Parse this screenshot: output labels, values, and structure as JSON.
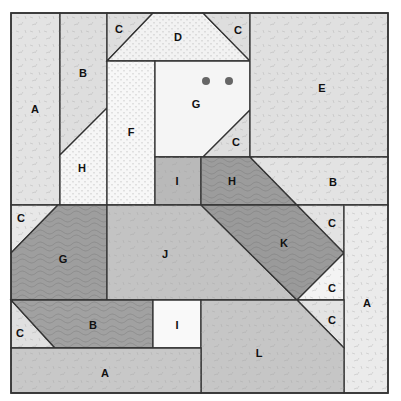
{
  "diagram": {
    "type": "quilt-block-pattern",
    "colors": {
      "light_print": "#e6e6e6",
      "pale_print": "#f1f1f1",
      "dotted_white": "#f6f6f6",
      "white": "#fafafa",
      "medium_print": "#c4c4c4",
      "dark_swirl": "#9d9d9d",
      "outline": "#333333",
      "eye": "#666666"
    },
    "pieces": [
      {
        "id": "A-left",
        "label": "A",
        "fill": "#e3e3e3",
        "points": "11,13 60,13 60,205 11,205",
        "lx": 35,
        "ly": 109
      },
      {
        "id": "B-top",
        "label": "B",
        "fill": "#dedede",
        "points": "60,13 107,13 107,108 60,155",
        "lx": 83,
        "ly": 73
      },
      {
        "id": "H-left",
        "label": "H",
        "fill": "#f6f6f6",
        "points": "60,155 107,108 107,205 60,205",
        "lx": 82,
        "ly": 168
      },
      {
        "id": "C-top-left",
        "label": "C",
        "fill": "#dedede",
        "points": "107,13 153,13 107,61",
        "lx": 119,
        "ly": 29
      },
      {
        "id": "D",
        "label": "D",
        "fill": "#f2f2f2",
        "points": "153,13 203,13 250,61 107,61",
        "lx": 178,
        "ly": 37
      },
      {
        "id": "C-top-right",
        "label": "C",
        "fill": "#dedede",
        "points": "203,13 250,13 250,61",
        "lx": 238,
        "ly": 30
      },
      {
        "id": "F",
        "label": "F",
        "fill": "#f7f7f7",
        "points": "107,61 155,61 155,205 107,205",
        "lx": 131,
        "ly": 132
      },
      {
        "id": "G-face",
        "label": "G",
        "fill": "#f5f5f5",
        "points": "155,61 250,61 250,110 203,157 155,157",
        "lx": 196,
        "ly": 104
      },
      {
        "id": "C-face",
        "label": "C",
        "fill": "#dedede",
        "points": "250,110 250,157 203,157",
        "lx": 236,
        "ly": 142
      },
      {
        "id": "E",
        "label": "E",
        "fill": "#e0e0e0",
        "points": "250,13 388,13 388,157 250,157",
        "lx": 322,
        "ly": 88
      },
      {
        "id": "I-mid",
        "label": "I",
        "fill": "#b9b9b9",
        "points": "155,157 201,157 201,205 155,205",
        "lx": 177,
        "ly": 181
      },
      {
        "id": "H-dark",
        "label": "H",
        "fill": "#9c9c9c",
        "points": "201,157 250,157 297,205 201,205",
        "lx": 232,
        "ly": 181
      },
      {
        "id": "B-right",
        "label": "B",
        "fill": "#e3e3e3",
        "points": "250,157 388,157 388,205 297,205",
        "lx": 333,
        "ly": 182
      },
      {
        "id": "C-row2-left",
        "label": "C",
        "fill": "#e8e8e8",
        "points": "11,205 58,205 11,253",
        "lx": 21,
        "ly": 218
      },
      {
        "id": "G-dark",
        "label": "G",
        "fill": "#9e9e9e",
        "points": "58,205 107,205 107,300 11,300 11,253",
        "lx": 63,
        "ly": 259
      },
      {
        "id": "J",
        "label": "J",
        "fill": "#c3c3c3",
        "points": "107,205 201,205 297,300 107,300",
        "lx": 165,
        "ly": 254
      },
      {
        "id": "K",
        "label": "K",
        "fill": "#9a9a9a",
        "points": "201,205 297,205 344,253 297,300",
        "lx": 284,
        "ly": 243
      },
      {
        "id": "C-k-top",
        "label": "C",
        "fill": "#e3e3e3",
        "points": "297,205 344,205 344,253",
        "lx": 332,
        "ly": 223
      },
      {
        "id": "C-k-bottom",
        "label": "C",
        "fill": "#f3f3f3",
        "points": "344,253 344,300 297,300",
        "lx": 332,
        "ly": 288
      },
      {
        "id": "A-right",
        "label": "A",
        "fill": "#ebebeb",
        "points": "344,205 388,205 388,393 344,393",
        "lx": 367,
        "ly": 303
      },
      {
        "id": "C-row3-left",
        "label": "C",
        "fill": "#e0e0e0",
        "points": "11,300 55,348 11,348",
        "lx": 20,
        "ly": 333
      },
      {
        "id": "B-dark",
        "label": "B",
        "fill": "#a1a1a1",
        "points": "11,300 153,300 153,348 55,348",
        "lx": 93,
        "ly": 325
      },
      {
        "id": "I-white",
        "label": "I",
        "fill": "#f9f9f9",
        "points": "153,300 201,300 201,348 153,348",
        "lx": 177,
        "ly": 325
      },
      {
        "id": "C-row3-right",
        "label": "C",
        "fill": "#e3e3e3",
        "points": "297,300 344,300 344,348",
        "lx": 332,
        "ly": 320
      },
      {
        "id": "L",
        "label": "L",
        "fill": "#c6c6c6",
        "points": "201,300 297,300 344,348 344,393 201,393",
        "lx": 259,
        "ly": 353
      },
      {
        "id": "A-bottom",
        "label": "A",
        "fill": "#c8c8c8",
        "points": "11,348 201,348 201,393 11,393",
        "lx": 105,
        "ly": 373
      }
    ],
    "eyes": [
      {
        "cx": 206,
        "cy": 81,
        "r": 4
      },
      {
        "cx": 229,
        "cy": 81,
        "r": 4
      }
    ],
    "outer": {
      "x": 11,
      "y": 13,
      "w": 377,
      "h": 380
    }
  }
}
